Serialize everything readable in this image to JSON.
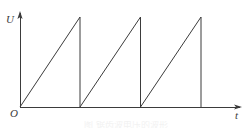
{
  "figure": {
    "name": "sawtooth-voltage-waveform",
    "background_color": "#ffffff",
    "line_color": "#3b3b3b",
    "line_width": 1
  },
  "axes": {
    "y_axis": {
      "label": "U",
      "name": "voltage-axis",
      "x": 20,
      "y_top": 13,
      "y_bottom": 107,
      "arrow": "up"
    },
    "x_axis": {
      "label": "t",
      "name": "time-axis",
      "y": 107,
      "x_left": 20,
      "x_right": 240,
      "arrow": "right"
    },
    "origin": {
      "label": "O",
      "x": 20,
      "y": 107
    }
  },
  "caption_ghost": "图  锯齿波电压的波形",
  "chart_data": {
    "type": "line",
    "title": "",
    "subtitle": "",
    "xlabel": "t",
    "ylabel": "U",
    "grid": false,
    "legend": null,
    "axis_arrows": true,
    "waveform": "sawtooth",
    "periods": 3,
    "period_px": 60.5,
    "amplitude_px": 90,
    "baseline_y": 107,
    "peak_y": 17,
    "ramp_start_x": 20,
    "drop_x_positions": [
      80,
      140.5,
      201
    ],
    "series": [
      {
        "name": "sawtooth",
        "points": [
          [
            20,
            107
          ],
          [
            80,
            17
          ],
          [
            80,
            107
          ],
          [
            140.5,
            17
          ],
          [
            140.5,
            107
          ],
          [
            201,
            17
          ],
          [
            201,
            107
          ]
        ]
      }
    ],
    "xlim": [
      20,
      240
    ],
    "ylim": [
      107,
      13
    ],
    "tick_labels_x": [],
    "tick_labels_y": [],
    "annotations": []
  }
}
